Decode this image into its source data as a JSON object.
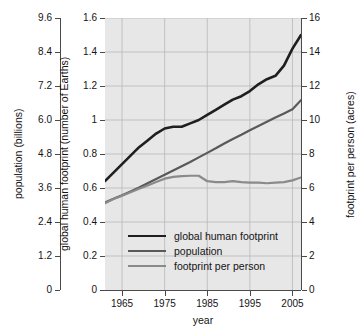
{
  "chart_data": {
    "type": "line",
    "title": "",
    "xlabel": "year",
    "x": [
      1961,
      1963,
      1965,
      1967,
      1969,
      1971,
      1973,
      1975,
      1977,
      1979,
      1981,
      1983,
      1985,
      1987,
      1989,
      1991,
      1993,
      1995,
      1997,
      1999,
      2001,
      2003,
      2005,
      2007
    ],
    "xlim": [
      1961,
      2007
    ],
    "xticks": [
      1965,
      1975,
      1985,
      1995,
      2005
    ],
    "xticklabels": [
      "1965",
      "1975",
      "1985",
      "1995",
      "2005"
    ],
    "grid": true,
    "legend_position": "lower center",
    "axes": [
      {
        "id": "population",
        "side": "left",
        "label": "population (billions)",
        "lim": [
          0,
          9.6
        ],
        "ticks": [
          0,
          1.2,
          2.4,
          3.6,
          4.8,
          6.0,
          7.2,
          8.4,
          9.6
        ],
        "ticklabels": [
          "0",
          "1.2",
          "2.4",
          "3.6",
          "4.8",
          "6.0",
          "7.2",
          "8.4",
          "9.6"
        ]
      },
      {
        "id": "footprint",
        "side": "left",
        "label": "global human footprint (number of Earths)",
        "lim": [
          0,
          1.6
        ],
        "ticks": [
          0,
          0.2,
          0.4,
          0.6,
          0.8,
          1.0,
          1.2,
          1.4,
          1.6
        ],
        "ticklabels": [
          "0",
          "0.2",
          "0.4",
          "0.6",
          "0.8",
          "1",
          "1.2",
          "1.4",
          "1.6"
        ]
      },
      {
        "id": "per_person",
        "side": "right",
        "label": "footprint per person (acres)",
        "lim": [
          0,
          16
        ],
        "ticks": [
          0,
          2,
          4,
          6,
          8,
          10,
          12,
          14,
          16
        ],
        "ticklabels": [
          "0",
          "2",
          "4",
          "6",
          "8",
          "10",
          "12",
          "14",
          "16"
        ]
      }
    ],
    "series": [
      {
        "name": "global human footprint",
        "axis": "footprint",
        "units": "number of Earths",
        "color": "#1f1f1f",
        "width": 2.6,
        "values": [
          0.64,
          0.69,
          0.74,
          0.79,
          0.84,
          0.88,
          0.92,
          0.95,
          0.96,
          0.96,
          0.98,
          1.0,
          1.03,
          1.06,
          1.09,
          1.12,
          1.14,
          1.17,
          1.21,
          1.24,
          1.26,
          1.32,
          1.42,
          1.5
        ]
      },
      {
        "name": "population",
        "axis": "population",
        "units": "billions",
        "color": "#595959",
        "width": 2.2,
        "values": [
          3.09,
          3.22,
          3.34,
          3.48,
          3.62,
          3.77,
          3.92,
          4.07,
          4.22,
          4.37,
          4.52,
          4.68,
          4.84,
          5.0,
          5.17,
          5.33,
          5.48,
          5.64,
          5.79,
          5.94,
          6.09,
          6.23,
          6.38,
          6.7
        ]
      },
      {
        "name": "footprint per person",
        "axis": "per_person",
        "units": "acres",
        "color": "#8a8a8a",
        "width": 2.2,
        "values": [
          5.1,
          5.35,
          5.55,
          5.75,
          5.95,
          6.15,
          6.35,
          6.55,
          6.65,
          6.7,
          6.72,
          6.72,
          6.4,
          6.35,
          6.35,
          6.4,
          6.35,
          6.32,
          6.32,
          6.28,
          6.32,
          6.35,
          6.45,
          6.62
        ]
      }
    ],
    "legend": [
      {
        "label": "global human footprint",
        "color": "#1f1f1f"
      },
      {
        "label": "population",
        "color": "#595959"
      },
      {
        "label": "footprint per person",
        "color": "#8a8a8a"
      }
    ]
  }
}
